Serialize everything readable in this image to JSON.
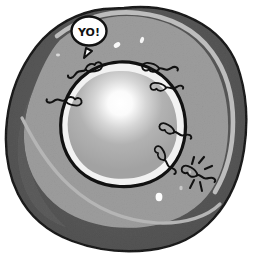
{
  "scene": {
    "title": "Cartoon cell cross-section",
    "canvas": {
      "width": 254,
      "height": 255
    },
    "background_color": "#ffffff"
  },
  "speech_bubble": {
    "text": "YO!",
    "fill_color": "#ffffff",
    "stroke_color": "#111111",
    "center": {
      "x": 89,
      "y": 31
    }
  },
  "cell": {
    "outer_membrane": {
      "name": "cell-cortex",
      "color": "#595959",
      "outline_color": "#141414"
    },
    "cytoplasm": {
      "name": "cytoplasm",
      "color": "#9b9b9b"
    },
    "membrane_highlight": {
      "name": "membrane-highlight-band",
      "color": "#b9b9b9"
    },
    "nucleus": {
      "name": "nucleus",
      "rim_color": "#efefef",
      "outline_color": "#111111",
      "body_color": "#a9a9a9",
      "highlight_color": "#ffffff",
      "center": {
        "x": 119,
        "y": 117
      },
      "radius": 53
    }
  },
  "organelles": {
    "label": "flagellated particles",
    "stroke_color": "#111111",
    "items": [
      {
        "name": "flagellate-top-left",
        "x": 77,
        "y": 66,
        "rot": -20,
        "scale": 1.0
      },
      {
        "name": "flagellate-left",
        "x": 57,
        "y": 97,
        "rot": 8,
        "scale": 0.95
      },
      {
        "name": "flagellate-top-right",
        "x": 166,
        "y": 70,
        "rot": 170,
        "scale": 1.0
      },
      {
        "name": "flagellate-right-upper",
        "x": 175,
        "y": 88,
        "rot": 168,
        "scale": 0.9
      },
      {
        "name": "flagellate-right-mid",
        "x": 180,
        "y": 133,
        "rot": 150,
        "scale": 0.95
      },
      {
        "name": "flagellate-right-low",
        "x": 168,
        "y": 160,
        "rot": 122,
        "scale": 0.9
      }
    ],
    "impact_particle": {
      "name": "flagellate-impact",
      "x": 196,
      "y": 176,
      "burst_color": "#111111"
    }
  },
  "vesicles": {
    "label": "white vesicles",
    "color": "#fbfbfb",
    "items": [
      {
        "name": "vesicle-1",
        "x": 117,
        "y": 45,
        "rx": 3.5,
        "ry": 2.3,
        "rot": -35
      },
      {
        "name": "vesicle-2",
        "x": 142,
        "y": 40,
        "rx": 2.0,
        "ry": 3.2,
        "rot": 20
      },
      {
        "name": "vesicle-3",
        "x": 159,
        "y": 197,
        "rx": 3.4,
        "ry": 4.2,
        "rot": 0
      },
      {
        "name": "vesicle-4",
        "x": 58,
        "y": 55,
        "rx": 2.0,
        "ry": 1.4,
        "rot": 0
      },
      {
        "name": "vesicle-5",
        "x": 181,
        "y": 188,
        "rx": 1.6,
        "ry": 2.1,
        "rot": 0
      },
      {
        "name": "vesicle-6",
        "x": 190,
        "y": 172,
        "rx": 1.3,
        "ry": 1.6,
        "rot": 0
      }
    ]
  }
}
